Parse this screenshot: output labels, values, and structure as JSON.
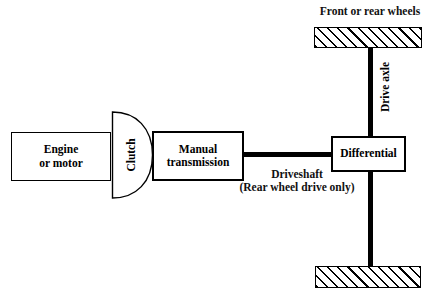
{
  "diagram": {
    "blocks": {
      "engine": {
        "line1": "Engine",
        "line2": "or motor"
      },
      "clutch": {
        "label": "Clutch"
      },
      "transmission": {
        "line1": "Manual",
        "line2": "transmission"
      },
      "differential": {
        "label": "Differential"
      }
    },
    "connectors": {
      "driveshaft": {
        "line1": "Driveshaft",
        "line2": "(Rear wheel drive only)"
      },
      "drive_axle": {
        "label": "Drive axle"
      }
    },
    "wheels": {
      "label": "Front or rear wheels",
      "top_name": "wheel-bar-top",
      "bottom_name": "wheel-bar-bottom"
    },
    "colors": {
      "stroke": "#000000",
      "fill": "#ffffff",
      "text": "#111111"
    }
  }
}
